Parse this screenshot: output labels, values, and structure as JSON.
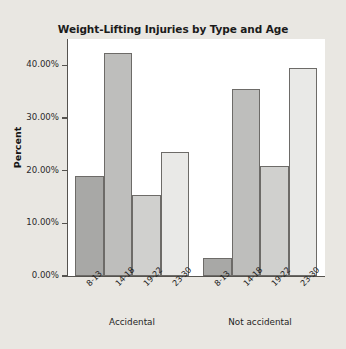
{
  "chart_data": {
    "type": "bar",
    "title": "Weight-Lifting Injuries by Type and Age",
    "xlabel": "",
    "ylabel": "Percent",
    "categories": [
      "8-13",
      "14-18",
      "19-22",
      "23-30"
    ],
    "groups": [
      "Accidental",
      "Not accidental"
    ],
    "series": [
      {
        "name": "Accidental",
        "values": [
          19.0,
          42.3,
          15.3,
          23.5
        ]
      },
      {
        "name": "Not accidental",
        "values": [
          3.5,
          35.5,
          20.8,
          39.4
        ]
      }
    ],
    "ylim": [
      0,
      45
    ],
    "ytick_values": [
      0,
      10,
      20,
      30,
      40
    ],
    "ytick_labels": [
      "0.00%",
      "10.00%",
      "20.00%",
      "30.00%",
      "40.00%"
    ],
    "grid": false,
    "legend": "none",
    "bar_colors": [
      "#a8a8a6",
      "#bebebc",
      "#d0d0ce",
      "#e9e9e7"
    ],
    "bar_border_color": "#6d6b68",
    "plot_background": "#ffffff",
    "figure_background": "#e9e7e2",
    "axis_color": "#55534f"
  }
}
